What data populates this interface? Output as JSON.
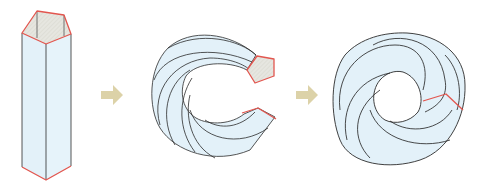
{
  "diagram": {
    "steps": [
      {
        "name": "straight-pentagonal-prism"
      },
      {
        "name": "bent-c-shaped-prism"
      },
      {
        "name": "closed-twisted-torus"
      }
    ],
    "arrows": [
      {
        "name": "step-arrow-1",
        "direction": "right"
      },
      {
        "name": "step-arrow-2",
        "direction": "right"
      }
    ],
    "colors": {
      "face_fill": "#e3f1f9",
      "end_cap_fill": "#e6e6e0",
      "edge_stroke": "#2b2b2b",
      "end_edge_stroke": "#e2564f",
      "arrow_fill": "#dcd2a8"
    }
  }
}
